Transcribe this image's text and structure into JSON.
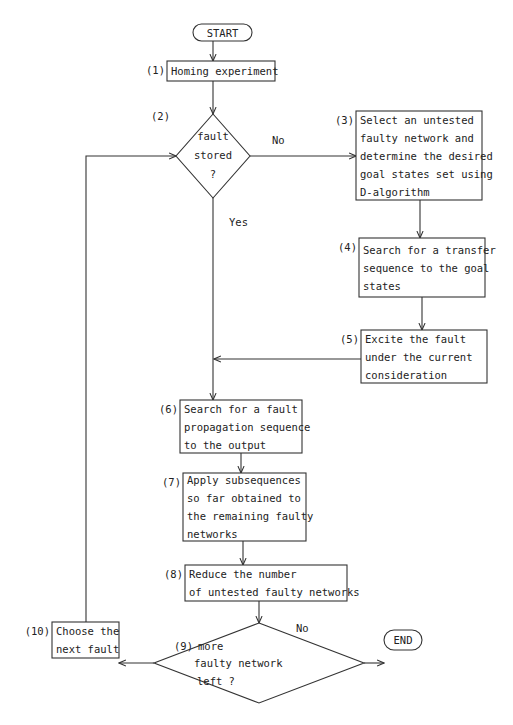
{
  "diagram": {
    "type": "flowchart",
    "start": {
      "label": "START"
    },
    "end": {
      "label": "END"
    },
    "steps": [
      {
        "id": 1,
        "tag": "(1)",
        "kind": "process",
        "lines": [
          "Homing experiment"
        ]
      },
      {
        "id": 2,
        "tag": "(2)",
        "kind": "decision",
        "lines": [
          "fault",
          "stored",
          "?"
        ]
      },
      {
        "id": 3,
        "tag": "(3)",
        "kind": "process",
        "lines": [
          "Select an untested",
          "faulty network and",
          "determine the desired",
          "goal states set using",
          "D-algorithm"
        ]
      },
      {
        "id": 4,
        "tag": "(4)",
        "kind": "process",
        "lines": [
          "Search for a transfer",
          "sequence to the goal",
          "states"
        ]
      },
      {
        "id": 5,
        "tag": "(5)",
        "kind": "process",
        "lines": [
          "Excite the fault",
          "under the current",
          "consideration"
        ]
      },
      {
        "id": 6,
        "tag": "(6)",
        "kind": "process",
        "lines": [
          "Search for a fault",
          "propagation sequence",
          "to the output"
        ]
      },
      {
        "id": 7,
        "tag": "(7)",
        "kind": "process",
        "lines": [
          "Apply subsequences",
          "so far obtained to",
          "the remaining faulty",
          "networks"
        ]
      },
      {
        "id": 8,
        "tag": "(8)",
        "kind": "process",
        "lines": [
          "Reduce the number",
          "of untested faulty networks"
        ]
      },
      {
        "id": 9,
        "tag": "(9)",
        "kind": "decision",
        "lines": [
          "more",
          "faulty network",
          "left ?"
        ]
      },
      {
        "id": 10,
        "tag": "(10)",
        "kind": "process",
        "lines": [
          "Choose the",
          "next fault"
        ]
      }
    ],
    "edges": [
      {
        "from": "START",
        "to": 1,
        "label": ""
      },
      {
        "from": 1,
        "to": 2,
        "label": ""
      },
      {
        "from": 2,
        "to": 3,
        "label": "No"
      },
      {
        "from": 2,
        "to": 6,
        "label": "Yes"
      },
      {
        "from": 3,
        "to": 4,
        "label": ""
      },
      {
        "from": 4,
        "to": 5,
        "label": ""
      },
      {
        "from": 5,
        "to": 6,
        "label": ""
      },
      {
        "from": 6,
        "to": 7,
        "label": ""
      },
      {
        "from": 7,
        "to": 8,
        "label": ""
      },
      {
        "from": 8,
        "to": 9,
        "label": ""
      },
      {
        "from": 9,
        "to": 10,
        "label": "Yes"
      },
      {
        "from": 9,
        "to": "END",
        "label": "No"
      },
      {
        "from": 10,
        "to": 2,
        "label": ""
      }
    ]
  }
}
